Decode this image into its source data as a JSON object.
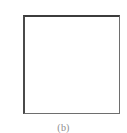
{
  "figure": {
    "caption": "(b)",
    "panel_label": "(b)",
    "box": {
      "fill_color": "#ffffff",
      "border_color": "#3c3c3c",
      "content": ""
    },
    "background_color": "#ffffff",
    "caption_color": "#8d8d8d"
  }
}
